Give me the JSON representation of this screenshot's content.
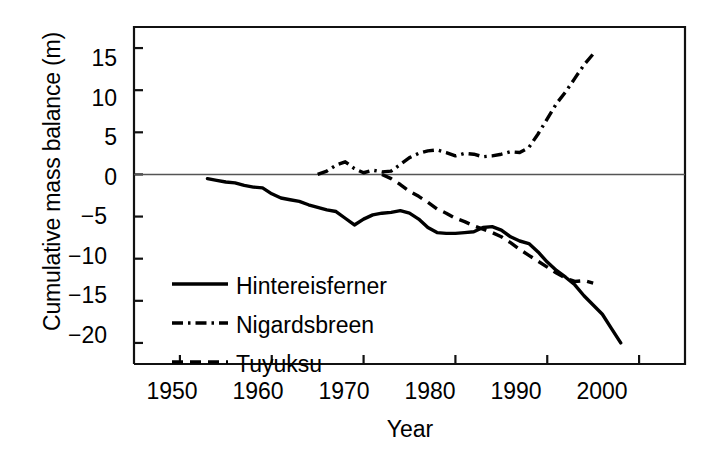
{
  "chart_data": {
    "type": "line",
    "title": "",
    "xlabel": "Year",
    "ylabel": "Cumulative mass balance (m)",
    "xlim": [
      1945,
      2005
    ],
    "ylim": [
      -22.5,
      17.5
    ],
    "xticks": [
      1950,
      1960,
      1970,
      1980,
      1990,
      2000
    ],
    "xtick_labels": [
      "1950",
      "1960",
      "1970",
      "1980",
      "1990",
      "2000"
    ],
    "yticks": [
      15,
      10,
      5,
      0,
      -5,
      -10,
      -15,
      -20
    ],
    "ytick_labels": [
      "15",
      "10",
      "5",
      "0",
      "−5",
      "−10",
      "−15",
      "−20"
    ],
    "grid": false,
    "zero_line": true,
    "legend_position": "lower-left-inside",
    "series": [
      {
        "name": "Hintereisferner",
        "style": "solid",
        "color": "#000000",
        "x": [
          1953,
          1954,
          1955,
          1956,
          1957,
          1958,
          1959,
          1960,
          1961,
          1962,
          1963,
          1964,
          1965,
          1966,
          1967,
          1968,
          1969,
          1970,
          1971,
          1972,
          1973,
          1974,
          1975,
          1976,
          1977,
          1978,
          1979,
          1980,
          1981,
          1982,
          1983,
          1984,
          1985,
          1986,
          1987,
          1988,
          1989,
          1990,
          1991,
          1992,
          1993,
          1994,
          1995,
          1996,
          1997,
          1998
        ],
        "y": [
          -0.5,
          -0.7,
          -0.9,
          -1.0,
          -1.3,
          -1.5,
          -1.6,
          -2.3,
          -2.8,
          -3.0,
          -3.2,
          -3.6,
          -3.9,
          -4.2,
          -4.4,
          -5.2,
          -6.0,
          -5.3,
          -4.8,
          -4.6,
          -4.5,
          -4.3,
          -4.6,
          -5.3,
          -6.3,
          -6.9,
          -7.0,
          -7.0,
          -6.9,
          -6.8,
          -6.3,
          -6.2,
          -6.6,
          -7.4,
          -7.9,
          -8.2,
          -9.2,
          -10.4,
          -11.4,
          -12.2,
          -13.1,
          -14.4,
          -15.5,
          -16.6,
          -18.3,
          -20.0
        ]
      },
      {
        "name": "Nigardsbreen",
        "style": "dashdot",
        "color": "#000000",
        "x": [
          1965,
          1966,
          1967,
          1968,
          1969,
          1970,
          1971,
          1972,
          1973,
          1974,
          1975,
          1976,
          1977,
          1978,
          1979,
          1980,
          1981,
          1982,
          1983,
          1984,
          1985,
          1986,
          1987,
          1988,
          1989,
          1990,
          1991,
          1992,
          1993,
          1994,
          1995
        ],
        "y": [
          0.0,
          0.4,
          1.1,
          1.5,
          0.7,
          0.2,
          0.5,
          0.3,
          0.4,
          1.2,
          2.0,
          2.5,
          2.8,
          2.9,
          2.6,
          2.2,
          2.5,
          2.4,
          2.1,
          2.2,
          2.4,
          2.7,
          2.6,
          3.2,
          4.8,
          6.6,
          8.4,
          9.8,
          11.4,
          13.0,
          14.3
        ]
      },
      {
        "name": "Tuyuksu",
        "style": "dashed",
        "color": "#000000",
        "x": [
          1972,
          1973,
          1974,
          1975,
          1976,
          1977,
          1978,
          1979,
          1980,
          1981,
          1982,
          1983,
          1984,
          1985,
          1986,
          1987,
          1988,
          1989,
          1990,
          1991,
          1992,
          1993,
          1994,
          1995
        ],
        "y": [
          0.0,
          -0.5,
          -1.2,
          -2.0,
          -2.6,
          -3.3,
          -4.1,
          -4.6,
          -5.2,
          -5.6,
          -6.1,
          -6.5,
          -6.9,
          -7.4,
          -8.1,
          -8.9,
          -9.6,
          -10.3,
          -11.0,
          -11.7,
          -12.3,
          -12.7,
          -12.6,
          -12.9
        ]
      }
    ]
  },
  "legend": {
    "entries": [
      {
        "label": "Hintereisferner",
        "style": "solid"
      },
      {
        "label": "Nigardsbreen",
        "style": "dashdot"
      },
      {
        "label": "Tuyuksu",
        "style": "dashed"
      }
    ]
  }
}
